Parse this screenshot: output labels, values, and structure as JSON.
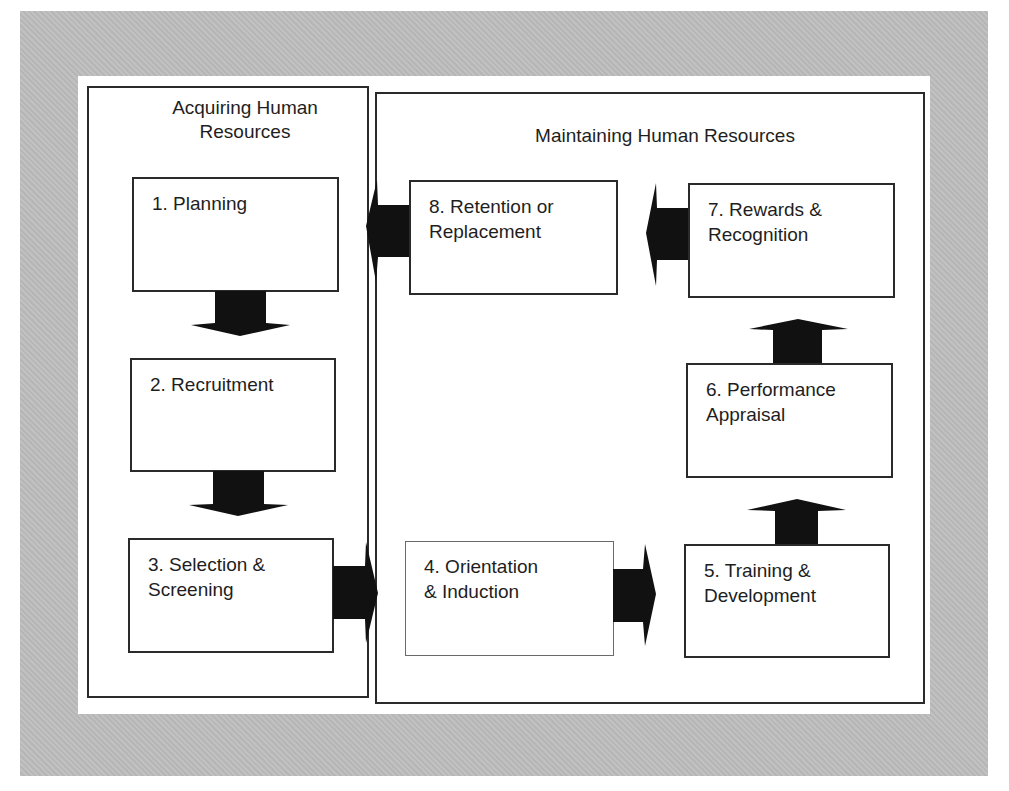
{
  "diagram": {
    "sections": [
      {
        "id": "acquiring",
        "title": "Acquiring Human\nResources"
      },
      {
        "id": "maintaining",
        "title": "Maintaining Human Resources"
      }
    ],
    "steps": [
      {
        "number": 1,
        "label": "1. Planning",
        "section": "acquiring"
      },
      {
        "number": 2,
        "label": "2. Recruitment",
        "section": "acquiring"
      },
      {
        "number": 3,
        "label": "3. Selection &\nScreening",
        "section": "acquiring"
      },
      {
        "number": 4,
        "label": "4. Orientation\n& Induction",
        "section": "maintaining"
      },
      {
        "number": 5,
        "label": "5. Training &\nDevelopment",
        "section": "maintaining"
      },
      {
        "number": 6,
        "label": "6. Performance\nAppraisal",
        "section": "maintaining"
      },
      {
        "number": 7,
        "label": "7. Rewards &\nRecognition",
        "section": "maintaining"
      },
      {
        "number": 8,
        "label": "8. Retention or\nReplacement",
        "section": "maintaining"
      }
    ],
    "flows": [
      {
        "from": 1,
        "to": 2,
        "direction": "down"
      },
      {
        "from": 2,
        "to": 3,
        "direction": "down"
      },
      {
        "from": 3,
        "to": 4,
        "direction": "right"
      },
      {
        "from": 4,
        "to": 5,
        "direction": "right"
      },
      {
        "from": 5,
        "to": 6,
        "direction": "up"
      },
      {
        "from": 6,
        "to": 7,
        "direction": "up"
      },
      {
        "from": 7,
        "to": 8,
        "direction": "left"
      },
      {
        "from": 8,
        "to": 1,
        "direction": "left"
      }
    ],
    "colors": {
      "background_gray": "#bdbdbd",
      "panel": "#ffffff",
      "border": "#2a2a2a",
      "arrow": "#111111",
      "text": "#1e1e1e"
    }
  }
}
